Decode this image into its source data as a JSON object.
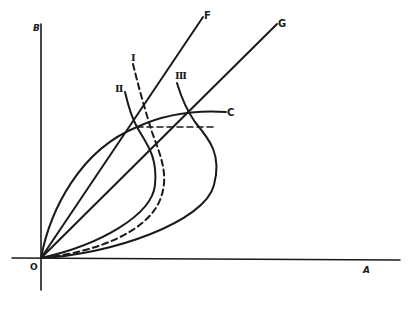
{
  "diagram": {
    "axes": {
      "x_label": "A",
      "y_label": "B",
      "origin_label": "O"
    },
    "rays": [
      {
        "label": "F"
      },
      {
        "label": "G"
      }
    ],
    "curves": [
      {
        "label": "C",
        "style": "solid"
      },
      {
        "label": "I",
        "style": "dashed"
      },
      {
        "label": "II",
        "style": "solid"
      },
      {
        "label": "III",
        "style": "solid"
      }
    ],
    "colors": {
      "ink": "#1a1a1a",
      "background": "#ffffff"
    }
  }
}
